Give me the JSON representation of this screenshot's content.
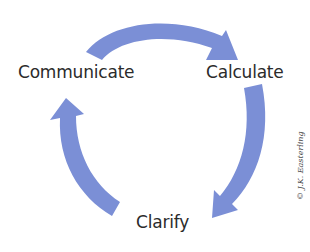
{
  "diagram": {
    "nodes": [
      {
        "id": "communicate",
        "label": "Communicate"
      },
      {
        "id": "calculate",
        "label": "Calculate"
      },
      {
        "id": "clarify",
        "label": "Clarify"
      }
    ],
    "edges": [
      {
        "from": "communicate",
        "to": "calculate"
      },
      {
        "from": "calculate",
        "to": "clarify"
      },
      {
        "from": "clarify",
        "to": "communicate"
      }
    ],
    "arrow_color": "#7b8fd6",
    "text_color": "#2b2b2b"
  },
  "copyright": "© J.K. Easterling"
}
